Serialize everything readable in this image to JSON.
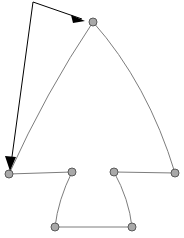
{
  "figure": {
    "background_color": "#ffffff",
    "width": 184,
    "height": 238
  },
  "annotation": {
    "label_text": "main reference",
    "label_clipped": true,
    "label_color": "#3a3a3a",
    "arrow_color": "#000000",
    "leaders": [
      {
        "name": "leader-to-apex",
        "from": [
          33,
          2
        ],
        "to": [
          84,
          20
        ],
        "target_vertex": "apex"
      },
      {
        "name": "leader-to-base-left",
        "from": [
          33,
          2
        ],
        "to": [
          10,
          168
        ],
        "target_vertex": "base-left-outer"
      }
    ]
  },
  "style": {
    "node_fill": "#a9a9a9",
    "node_stroke": "#5a5a5a",
    "node_radius": 4,
    "edge_stroke": "#7d7d7d",
    "edge_width": 1
  },
  "chart_data": {
    "type": "scatter",
    "xlabel": "",
    "ylabel": "",
    "xlim": [
      0,
      184
    ],
    "ylim": [
      0,
      238
    ],
    "grid": false,
    "legend": "none",
    "vertices": [
      {
        "id": "apex",
        "label": "apex",
        "x": 93,
        "y": 22
      },
      {
        "id": "base-left-outer",
        "label": "base-left-outer",
        "x": 9,
        "y": 174
      },
      {
        "id": "base-left-inner",
        "label": "base-left-inner",
        "x": 72,
        "y": 172
      },
      {
        "id": "base-right-inner",
        "label": "base-right-inner",
        "x": 114,
        "y": 172
      },
      {
        "id": "base-right-outer",
        "label": "base-right-outer",
        "x": 175,
        "y": 173
      },
      {
        "id": "foot-left",
        "label": "foot-left",
        "x": 55,
        "y": 227
      },
      {
        "id": "foot-right",
        "label": "foot-right",
        "x": 132,
        "y": 227
      }
    ],
    "edges": [
      {
        "id": "arch-left",
        "from": "apex",
        "to": "base-left-outer",
        "kind": "curve",
        "control": [
          46,
          92
        ]
      },
      {
        "id": "arch-right",
        "from": "apex",
        "to": "base-right-outer",
        "kind": "curve",
        "control": [
          148,
          84
        ]
      },
      {
        "id": "base-left",
        "from": "base-left-outer",
        "to": "base-left-inner",
        "kind": "straight",
        "control": null
      },
      {
        "id": "base-right",
        "from": "base-right-inner",
        "to": "base-right-outer",
        "kind": "straight",
        "control": null
      },
      {
        "id": "leg-left",
        "from": "base-left-inner",
        "to": "foot-left",
        "kind": "curve",
        "control": [
          58,
          200
        ]
      },
      {
        "id": "leg-right",
        "from": "base-right-inner",
        "to": "foot-right",
        "kind": "curve",
        "control": [
          129,
          199
        ]
      },
      {
        "id": "foot-base",
        "from": "foot-left",
        "to": "foot-right",
        "kind": "straight",
        "control": null
      }
    ]
  }
}
